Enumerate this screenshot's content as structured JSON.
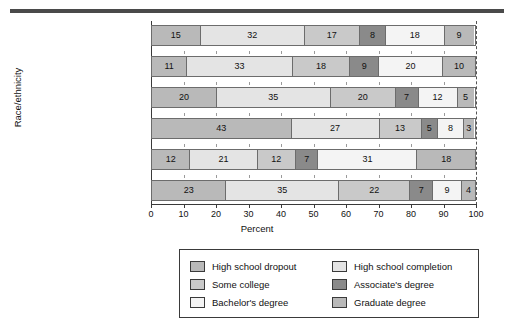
{
  "chart_data": {
    "type": "bar",
    "orientation": "horizontal",
    "stacked": true,
    "title": "",
    "xlabel": "Percent",
    "ylabel": "Race/ethnicity",
    "xlim": [
      0,
      100
    ],
    "xticks": [
      0,
      10,
      20,
      30,
      40,
      50,
      60,
      70,
      80,
      90,
      100
    ],
    "grid": false,
    "legend_position": "bottom",
    "reference_line": 100,
    "categories": [
      "Total",
      "White, non-Hispanic",
      "Black, non-Hispanic",
      "Hispanic",
      "Asian/Pacific Islander",
      "American Indian/\nAlaska Native"
    ],
    "series": [
      {
        "name": "High school dropout",
        "color": "#b9b9b9",
        "values": [
          15,
          11,
          20,
          43,
          12,
          23
        ]
      },
      {
        "name": "High school completion",
        "color": "#e4e4e4",
        "values": [
          32,
          33,
          35,
          27,
          21,
          35
        ]
      },
      {
        "name": "Some college",
        "color": "#c9c9c9",
        "values": [
          17,
          18,
          20,
          13,
          12,
          22
        ]
      },
      {
        "name": "Associate's degree",
        "color": "#8a8a8a",
        "values": [
          8,
          9,
          7,
          5,
          7,
          7
        ]
      },
      {
        "name": "Bachelor's degree",
        "color": "#f4f4f4",
        "values": [
          18,
          20,
          12,
          8,
          31,
          9
        ]
      },
      {
        "name": "Graduate degree",
        "color": "#b9b9b9",
        "values": [
          9,
          10,
          5,
          3,
          18,
          4
        ]
      }
    ]
  },
  "legend": {
    "items": [
      {
        "label": "High school dropout",
        "color": "#b9b9b9"
      },
      {
        "label": "High school completion",
        "color": "#e4e4e4"
      },
      {
        "label": "Some college",
        "color": "#c9c9c9"
      },
      {
        "label": "Associate's degree",
        "color": "#8a8a8a"
      },
      {
        "label": "Bachelor's degree",
        "color": "#f4f4f4"
      },
      {
        "label": "Graduate degree",
        "color": "#b9b9b9"
      }
    ]
  }
}
